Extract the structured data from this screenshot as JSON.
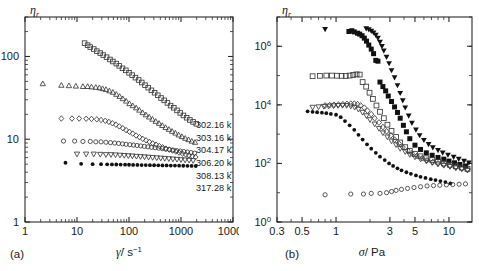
{
  "figure": {
    "panels": [
      {
        "id": "a",
        "panel_label": "(a)",
        "xlabel_symbol": "γ̇",
        "xlabel_unit": "/ s",
        "xlabel_exponent": "−1",
        "ylabel": "η",
        "ylabel_sub": "r"
      },
      {
        "id": "b",
        "panel_label": "(b)",
        "xlabel_symbol": "σ",
        "xlabel_unit": "/ Pa",
        "xlabel_exponent": "",
        "ylabel": "η",
        "ylabel_sub": "r"
      }
    ],
    "legend": {
      "items": [
        {
          "label": "302.16 k",
          "marker": "open-square"
        },
        {
          "label": "303.16 k",
          "marker": "open-triangle-up"
        },
        {
          "label": "304.17 k",
          "marker": "open-diamond"
        },
        {
          "label": "306.20 k",
          "marker": "open-circle"
        },
        {
          "label": "308.13 k",
          "marker": "open-triangle-down"
        },
        {
          "label": "317.28 k",
          "marker": "filled-circle"
        }
      ]
    }
  },
  "chart_data": [
    {
      "type": "scatter",
      "id": "a",
      "title": "",
      "xlabel": "γ̇ / s⁻¹",
      "ylabel": "ηr",
      "xscale": "log",
      "yscale": "log",
      "xlim": [
        1,
        10000
      ],
      "ylim": [
        1,
        300
      ],
      "xticks": [
        1,
        10,
        100,
        1000,
        10000
      ],
      "xticklabels": [
        "1",
        "10",
        "100",
        "1000",
        "10000"
      ],
      "yticks": [
        1,
        10,
        100
      ],
      "yticklabels": [
        "1",
        "10",
        "100"
      ],
      "grid": false,
      "legend_position": "right-inside",
      "series": [
        {
          "name": "302.16 k",
          "marker": "open-square",
          "x": [
            14,
            16,
            18,
            21,
            24,
            28,
            32,
            37,
            43,
            49,
            57,
            65,
            75,
            87,
            100,
            115,
            133,
            153,
            176,
            203,
            234,
            270,
            311,
            358,
            413,
            476,
            548,
            631,
            728,
            839,
            967,
            1114,
            1284,
            1480,
            1706,
            1966
          ],
          "y": [
            145,
            137,
            130,
            123,
            116,
            110,
            104,
            98,
            92,
            87,
            82,
            77,
            72,
            68,
            63.5,
            59.5,
            55.5,
            52,
            48.5,
            45,
            42,
            39,
            36.5,
            34,
            31.5,
            29.5,
            27.5,
            25.5,
            24,
            22.3,
            20.8,
            19.4,
            18.2,
            17.1,
            16.2,
            15.4
          ]
        },
        {
          "name": "303.16 k",
          "marker": "open-triangle-up",
          "x": [
            2.2,
            5.0,
            7.0,
            9.5,
            13,
            16,
            19,
            23,
            27,
            31,
            36,
            42,
            49,
            57,
            66,
            76,
            88,
            102,
            118,
            137,
            158,
            183,
            211,
            244,
            282,
            326,
            377,
            436,
            504,
            583,
            674,
            779,
            901,
            1042,
            1205,
            1393,
            1611,
            1863
          ],
          "y": [
            47,
            45,
            44.5,
            44,
            43.5,
            43.5,
            43,
            42.5,
            42,
            41,
            40,
            38.5,
            37,
            35,
            33,
            31,
            29,
            27,
            25.5,
            24,
            22.5,
            21,
            19.8,
            18.6,
            17.5,
            16.5,
            15.6,
            14.7,
            13.9,
            13.2,
            12.5,
            11.9,
            11.3,
            10.8,
            10.3,
            9.9,
            9.5,
            9.2
          ]
        },
        {
          "name": "304.17 k",
          "marker": "open-diamond",
          "x": [
            5.0,
            8.0,
            11,
            15,
            19,
            24,
            29,
            35,
            41,
            48,
            56,
            65,
            76,
            88,
            102,
            118,
            137,
            159,
            184,
            213,
            247,
            286,
            331,
            383,
            443,
            513,
            594,
            687,
            795,
            920,
            1065,
            1232,
            1426,
            1650,
            1909
          ],
          "y": [
            17.8,
            17.8,
            17.8,
            17.7,
            17.6,
            17.4,
            17.1,
            16.7,
            16.2,
            15.6,
            15.0,
            14.3,
            13.6,
            12.9,
            12.3,
            11.7,
            11.1,
            10.6,
            10.1,
            9.7,
            9.3,
            8.9,
            8.6,
            8.3,
            8.0,
            7.7,
            7.5,
            7.3,
            7.1,
            6.9,
            6.7,
            6.55,
            6.4,
            6.25,
            6.1
          ]
        },
        {
          "name": "306.20 k",
          "marker": "open-circle",
          "x": [
            5.5,
            9,
            13,
            18,
            23,
            29,
            36,
            44,
            53,
            63,
            75,
            88,
            104,
            122,
            143,
            168,
            197,
            231,
            271,
            318,
            373,
            437,
            512,
            601,
            705,
            826,
            969,
            1136,
            1332,
            1562,
            1832
          ],
          "y": [
            9.5,
            9.5,
            9.4,
            9.4,
            9.3,
            9.3,
            9.2,
            9.1,
            9.0,
            8.9,
            8.8,
            8.7,
            8.6,
            8.5,
            8.4,
            8.3,
            8.2,
            8.1,
            8.0,
            7.9,
            7.8,
            7.7,
            7.6,
            7.5,
            7.4,
            7.3,
            7.2,
            7.1,
            7.0,
            6.9,
            6.8
          ]
        },
        {
          "name": "308.13 k",
          "marker": "open-triangle-down",
          "x": [
            10,
            15,
            21,
            28,
            36,
            45,
            55,
            67,
            81,
            97,
            116,
            139,
            166,
            199,
            238,
            285,
            341,
            408,
            488,
            584,
            699,
            836,
            1000,
            1197,
            1432,
            1713
          ],
          "y": [
            6.6,
            6.6,
            6.6,
            6.55,
            6.5,
            6.5,
            6.45,
            6.4,
            6.35,
            6.3,
            6.25,
            6.2,
            6.15,
            6.1,
            6.05,
            6.0,
            5.95,
            5.9,
            5.85,
            5.8,
            5.75,
            5.7,
            5.65,
            5.6,
            5.55,
            5.5
          ]
        },
        {
          "name": "317.28 k",
          "marker": "filled-circle",
          "x": [
            6,
            12,
            20,
            29,
            38,
            47,
            57,
            69,
            84,
            100,
            120,
            145,
            175,
            210,
            253,
            304,
            366,
            440,
            529,
            636,
            765,
            920,
            1106,
            1330,
            1600,
            1924
          ],
          "y": [
            5.2,
            5.05,
            5.0,
            5.0,
            4.98,
            4.96,
            4.95,
            4.94,
            4.93,
            4.92,
            4.9,
            4.9,
            4.88,
            4.87,
            4.86,
            4.85,
            4.84,
            4.83,
            4.82,
            4.81,
            4.8,
            4.79,
            4.78,
            4.77,
            4.76,
            4.75
          ]
        }
      ]
    },
    {
      "type": "scatter",
      "id": "b",
      "title": "",
      "xlabel": "σ / Pa",
      "ylabel": "ηr",
      "xscale": "log",
      "yscale": "log",
      "xlim": [
        0.3,
        16
      ],
      "ylim": [
        1,
        10000000
      ],
      "xticks": [
        0.3,
        0.5,
        1,
        3,
        5,
        10
      ],
      "xticklabels": [
        "0.3",
        "0.5",
        "1",
        "3",
        "5",
        "10"
      ],
      "yticks": [
        1,
        100,
        10000,
        1000000
      ],
      "yticklabels": [
        "10⁰",
        "10²",
        "10⁴",
        "10⁶"
      ],
      "grid": false,
      "legend_position": "none",
      "series": [
        {
          "name": "302.16 k",
          "marker": "filled-square",
          "x": [
            1.3,
            1.38,
            1.45,
            1.55,
            1.62,
            1.7,
            1.78,
            1.86,
            1.95,
            2.05,
            2.15,
            2.25,
            2.35,
            2.45,
            2.6,
            2.75,
            2.9,
            3.1,
            3.3,
            3.5,
            3.7,
            3.95,
            4.2,
            4.5,
            5.0,
            5.6,
            6.3,
            7.1,
            8.0,
            9.0,
            10.0,
            11.2,
            12.5,
            14.0
          ],
          "y": [
            3200000,
            3400000,
            3100000,
            2800000,
            2600000,
            2300000,
            1900000,
            1500000,
            1100000,
            800000,
            560000,
            330000,
            310000,
            60000,
            42000,
            30000,
            20000,
            13000,
            8500,
            5500,
            3500,
            2000,
            1200,
            700,
            420,
            300,
            230,
            190,
            160,
            140,
            120,
            105,
            92,
            82
          ]
        },
        {
          "name": "303.16 k",
          "marker": "filled-triangle-down",
          "x": [
            0.8,
            1.85,
            1.95,
            2.05,
            2.15,
            2.25,
            2.35,
            2.45,
            2.55,
            2.65,
            2.8,
            2.95,
            3.1,
            3.3,
            3.5,
            3.7,
            3.9,
            4.1,
            4.4,
            4.7,
            5.1,
            5.5,
            6.0,
            6.6,
            7.2,
            8.0,
            8.8,
            9.8,
            11.0,
            12.2,
            13.6,
            15.0
          ],
          "y": [
            3800000,
            4000000,
            3700000,
            3300000,
            2900000,
            2400000,
            1900000,
            1400000,
            1000000,
            700000,
            430000,
            260000,
            150000,
            85000,
            46000,
            25000,
            14000,
            8000,
            4200,
            2400,
            1400,
            900,
            620,
            450,
            350,
            280,
            230,
            195,
            165,
            140,
            120,
            105
          ]
        },
        {
          "name": "304.17 k",
          "marker": "open-square",
          "x": [
            0.62,
            0.72,
            0.82,
            0.92,
            1.02,
            1.12,
            1.22,
            1.32,
            1.42,
            1.52,
            1.62,
            1.72,
            1.85,
            1.98,
            2.12,
            2.28,
            2.45,
            2.65,
            2.85,
            3.1,
            3.4,
            3.7,
            4.1,
            4.5,
            5.0,
            5.6,
            6.3,
            7.1,
            8.0,
            9.0,
            10.2,
            11.5,
            13.0,
            14.6
          ],
          "y": [
            95000,
            98000,
            100000,
            100000,
            99000,
            98000,
            97000,
            100000,
            105000,
            110000,
            108000,
            60000,
            42000,
            26000,
            16000,
            9500,
            5800,
            3500,
            2100,
            1300,
            800,
            520,
            360,
            270,
            210,
            175,
            150,
            130,
            115,
            100,
            90,
            80,
            72,
            65
          ]
        },
        {
          "name": "306.20 k",
          "marker": "open-diamond",
          "x": [
            0.8,
            0.88,
            0.96,
            1.05,
            1.15,
            1.25,
            1.35,
            1.45,
            1.55,
            1.65,
            1.78,
            1.9,
            2.05,
            2.2,
            2.4,
            2.6,
            2.8,
            3.05,
            3.3,
            3.6,
            3.9,
            4.3,
            4.7,
            5.2,
            5.8,
            6.4,
            7.2,
            8.0,
            9.0,
            10.2,
            11.5,
            13.0,
            14.6
          ],
          "y": [
            9500,
            9800,
            10000,
            10200,
            10500,
            10800,
            11000,
            11000,
            10500,
            9500,
            8000,
            6300,
            4800,
            3500,
            2500,
            1750,
            1250,
            900,
            650,
            480,
            360,
            280,
            220,
            180,
            150,
            128,
            112,
            100,
            90,
            82,
            74,
            68,
            62
          ]
        },
        {
          "name": "308.13 k",
          "marker": "open-triangle-down",
          "x": [
            0.62,
            0.7,
            0.78,
            0.86,
            0.95,
            1.04,
            1.14,
            1.24,
            1.35,
            1.46,
            1.58,
            1.72,
            1.86,
            2.0,
            2.2,
            2.4,
            2.6,
            2.85,
            3.1,
            3.4,
            3.7,
            4.1,
            4.5,
            5.0,
            5.6,
            6.3,
            7.1,
            8.0,
            9.0,
            10.2,
            11.5,
            13.0,
            14.6
          ],
          "y": [
            8200,
            8500,
            8800,
            9000,
            9200,
            9400,
            9500,
            9400,
            9000,
            8200,
            7000,
            5500,
            4200,
            3100,
            2200,
            1550,
            1100,
            800,
            580,
            430,
            320,
            250,
            200,
            165,
            140,
            120,
            105,
            95,
            85,
            78,
            70,
            64,
            58
          ]
        },
        {
          "name": "317.28 k",
          "marker": "filled-circle",
          "x": [
            0.56,
            0.62,
            0.68,
            0.75,
            0.82,
            0.9,
            1.0,
            1.1,
            1.2,
            1.32,
            1.45,
            1.58,
            1.72,
            1.88,
            2.05,
            2.25,
            2.45,
            2.7,
            2.95,
            3.2,
            3.5,
            3.8,
            4.2,
            4.6,
            5.1,
            5.6,
            6.2,
            6.9,
            7.6,
            8.4,
            9.3,
            10.3
          ],
          "y": [
            6000,
            5800,
            5600,
            5400,
            5200,
            4900,
            4600,
            3800,
            2800,
            2000,
            1400,
            950,
            650,
            450,
            320,
            230,
            170,
            130,
            100,
            82,
            68,
            58,
            50,
            44,
            39,
            35,
            32,
            29,
            27,
            25,
            23,
            21
          ]
        },
        {
          "name": "low-branch",
          "marker": "open-circle",
          "x": [
            0.8,
            1.35,
            1.75,
            2.05,
            2.45,
            2.8,
            3.1,
            3.4,
            3.8,
            4.3,
            4.9,
            5.6,
            6.4,
            7.3,
            8.3,
            9.5,
            10.8,
            12.3,
            14.0
          ],
          "y": [
            8.5,
            9.0,
            9.0,
            9.5,
            9.5,
            10,
            11,
            12,
            13,
            14,
            15,
            16,
            17,
            17.5,
            18,
            18.5,
            19,
            19.5,
            20
          ]
        }
      ]
    }
  ]
}
